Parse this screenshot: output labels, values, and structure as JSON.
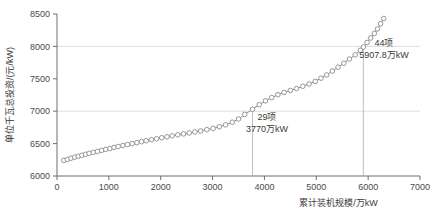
{
  "chart_data": {
    "type": "line",
    "title": "",
    "xlabel": "累计装机规模/万kW",
    "ylabel": "单位千瓦总投资/(元/kW)",
    "xlim": [
      0,
      7000
    ],
    "ylim": [
      6000,
      8500
    ],
    "xticks": [
      0,
      1000,
      2000,
      3000,
      4000,
      5000,
      6000,
      7000
    ],
    "yticks": [
      6000,
      6500,
      7000,
      7500,
      8000,
      8500
    ],
    "xtick_labels": [
      "0",
      "1000",
      "2000",
      "3000",
      "4000",
      "5000",
      "6000",
      "7000"
    ],
    "ytick_labels": [
      "6000",
      "6500",
      "7000",
      "7500",
      "8000",
      "8500"
    ],
    "grid": "horizontal-at-7000-and-8000",
    "legend": "none",
    "marker": "open-circle",
    "line_color": "#8c8c8c",
    "marker_color": "#8c8c8c",
    "series": [
      {
        "name": "单位千瓦总投资",
        "x": [
          130,
          200,
          270,
          340,
          410,
          480,
          550,
          620,
          700,
          780,
          860,
          940,
          1020,
          1100,
          1180,
          1270,
          1360,
          1450,
          1540,
          1630,
          1720,
          1820,
          1920,
          2020,
          2120,
          2220,
          2330,
          2440,
          2550,
          2660,
          2770,
          2890,
          3010,
          3130,
          3250,
          3380,
          3500,
          3620,
          3770,
          3900,
          4020,
          4140,
          4260,
          4380,
          4500,
          4620,
          4740,
          4860,
          4980,
          5090,
          5200,
          5310,
          5420,
          5530,
          5640,
          5750,
          5850,
          5907.8,
          5980,
          6050,
          6120,
          6180,
          6240,
          6300
        ],
        "y": [
          6240,
          6255,
          6275,
          6290,
          6305,
          6320,
          6335,
          6350,
          6365,
          6380,
          6395,
          6410,
          6425,
          6440,
          6455,
          6470,
          6485,
          6500,
          6515,
          6530,
          6545,
          6560,
          6575,
          6590,
          6605,
          6620,
          6635,
          6650,
          6665,
          6680,
          6695,
          6715,
          6735,
          6760,
          6790,
          6830,
          6880,
          6950,
          7030,
          7100,
          7160,
          7210,
          7255,
          7290,
          7320,
          7350,
          7385,
          7420,
          7460,
          7510,
          7560,
          7620,
          7680,
          7740,
          7805,
          7870,
          7940,
          7990,
          8060,
          8130,
          8200,
          8270,
          8350,
          8430
        ]
      }
    ],
    "reference_lines": [
      {
        "x": 3770,
        "y_top": 7030,
        "label_count": "29项",
        "label_value": "3770万kW"
      },
      {
        "x": 5907.8,
        "y_top": 7990,
        "label_count": "44项",
        "label_value": "5907.8万kW"
      }
    ],
    "annotations": [
      {
        "id": "anno-1",
        "line1": "29项",
        "line2": "3770万kW",
        "x_px": 255,
        "y_px": 120
      },
      {
        "id": "anno-2",
        "line1": "44项",
        "line2": "5907.8万kW",
        "x_px": 364,
        "y_px": 46
      }
    ]
  }
}
